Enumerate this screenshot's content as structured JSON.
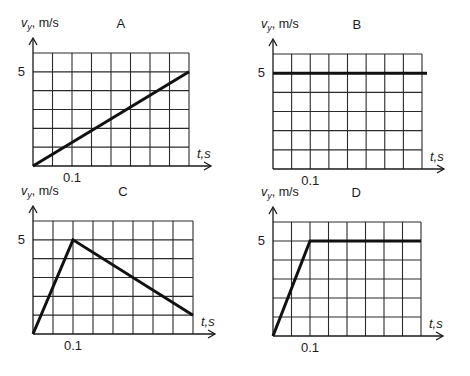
{
  "chart_data": [
    {
      "type": "line",
      "panel_label": "A",
      "ylabel_var": "v",
      "ylabel_sub": "y",
      "ylabel_unit": ", m/s",
      "xlabel": "t,s",
      "y_tick_label": "5",
      "x_tick_label": "0.1",
      "grid": true,
      "grid_cols": 8,
      "grid_rows": 6,
      "x_step": 0.05,
      "y_step": 1,
      "xlim": [
        0,
        0.4
      ],
      "ylim": [
        0,
        6
      ],
      "x": [
        0,
        0.4
      ],
      "y": [
        0,
        5
      ]
    },
    {
      "type": "line",
      "panel_label": "B",
      "ylabel_var": "v",
      "ylabel_sub": "y",
      "ylabel_unit": ", m/s",
      "xlabel": "t,s",
      "y_tick_label": "5",
      "x_tick_label": "0.1",
      "grid": true,
      "grid_cols": 8,
      "grid_rows": 6,
      "x_step": 0.05,
      "y_step": 1,
      "xlim": [
        0,
        0.4
      ],
      "ylim": [
        0,
        6
      ],
      "x": [
        0,
        0.4
      ],
      "y": [
        5,
        5
      ]
    },
    {
      "type": "line",
      "panel_label": "C",
      "ylabel_var": "v",
      "ylabel_sub": "y",
      "ylabel_unit": ", m/s",
      "xlabel": "t,s",
      "y_tick_label": "5",
      "x_tick_label": "0.1",
      "grid": true,
      "grid_cols": 8,
      "grid_rows": 6,
      "x_step": 0.05,
      "y_step": 1,
      "xlim": [
        0,
        0.4
      ],
      "ylim": [
        0,
        6
      ],
      "x": [
        0,
        0.1,
        0.4
      ],
      "y": [
        0,
        5,
        1
      ]
    },
    {
      "type": "line",
      "panel_label": "D",
      "ylabel_var": "v",
      "ylabel_sub": "y",
      "ylabel_unit": ", m/s",
      "xlabel": "t,s",
      "y_tick_label": "5",
      "x_tick_label": "0.1",
      "grid": true,
      "grid_cols": 8,
      "grid_rows": 6,
      "x_step": 0.05,
      "y_step": 1,
      "xlim": [
        0,
        0.4
      ],
      "ylim": [
        0,
        6
      ],
      "x": [
        0,
        0.1,
        0.4
      ],
      "y": [
        0,
        5,
        5
      ]
    }
  ]
}
